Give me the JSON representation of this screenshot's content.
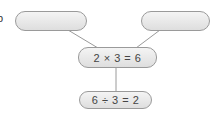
{
  "marker": "b",
  "nodes": {
    "top_left": {
      "text": ""
    },
    "top_right": {
      "text": ""
    },
    "middle": {
      "text": "2 × 3 = 6"
    },
    "bottom": {
      "text": "6 ÷ 3 = 2"
    }
  },
  "colors": {
    "border": "#9a9a9a",
    "fill_top": "#f4f4f4",
    "fill_bottom": "#dedede",
    "line": "#9a9a9a",
    "text": "#444444"
  }
}
